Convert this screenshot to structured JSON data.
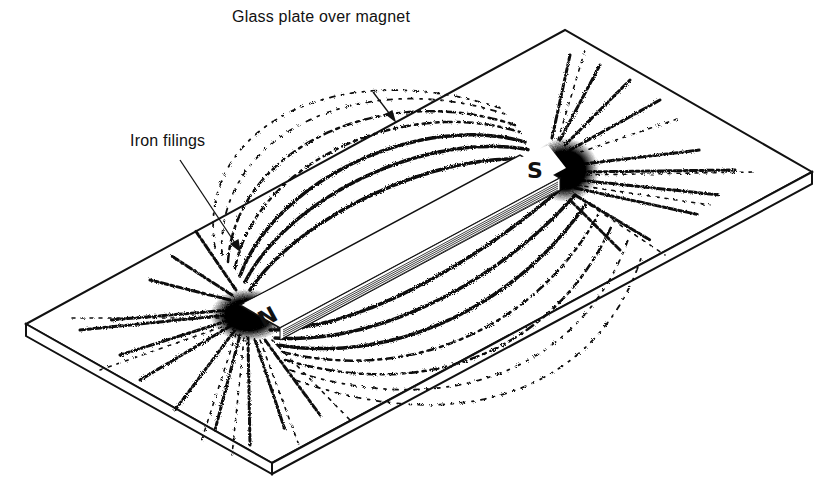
{
  "diagram": {
    "labels": {
      "glass_plate": "Glass plate over magnet",
      "iron_filings": "Iron filings"
    },
    "magnet": {
      "north_pole": "N",
      "south_pole": "S"
    },
    "colors": {
      "ink": "#111111",
      "background": "#ffffff"
    }
  }
}
